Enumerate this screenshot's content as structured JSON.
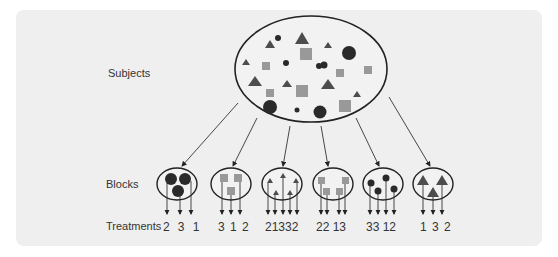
{
  "labels": {
    "subjects": "Subjects",
    "blocks": "Blocks",
    "treatments": "Treatments"
  },
  "colors": {
    "panel": "#efefef",
    "stroke": "#222222",
    "circle_fill": "#2a2a2a",
    "square_fill": "#999999",
    "triangle_fill": "#4d4d4d"
  },
  "blocks": [
    {
      "shape": "circles",
      "treatments": "2  3  1"
    },
    {
      "shape": "squares",
      "treatments": "3 1 2"
    },
    {
      "shape": "triangles",
      "treatments": "21332"
    },
    {
      "shape": "squares",
      "treatments": "22 13"
    },
    {
      "shape": "circles",
      "treatments": "33 12"
    },
    {
      "shape": "triangles",
      "treatments": "1 3 2"
    }
  ]
}
